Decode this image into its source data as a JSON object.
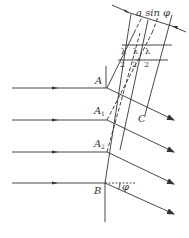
{
  "diagram": {
    "colors": {
      "line": "#333333",
      "background": "#ffffff"
    },
    "labels": {
      "A": "A",
      "A1": "A",
      "A1_sub": "1",
      "A2": "A",
      "A2_sub": "2",
      "B": "B",
      "C": "C",
      "phi": "φ",
      "width_label": "a sin φ",
      "half_wave": [
        "λ",
        "λ",
        "λ"
      ],
      "half_wave_den": [
        "2",
        "2",
        "2"
      ]
    },
    "incident_rays": 4,
    "diffracted_rays": 4,
    "half_wave_zones": 3
  }
}
